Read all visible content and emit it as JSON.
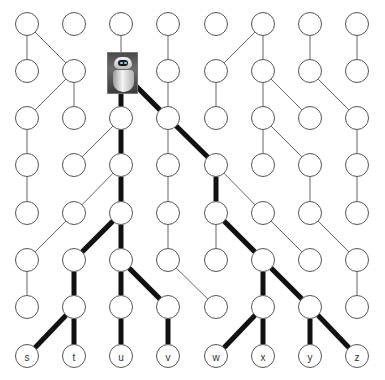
{
  "diagram": {
    "type": "tree-grid",
    "grid": {
      "columns_x": [
        27,
        74,
        121,
        168,
        216,
        263,
        310,
        357
      ],
      "rows_y": [
        24,
        71,
        118,
        165,
        213,
        260,
        307,
        356
      ],
      "node_radius": 11.5
    },
    "root_image": {
      "col": 2,
      "row": 1,
      "icon": "robot-icon",
      "label": "robot"
    },
    "leaf_labels": [
      "s",
      "t",
      "u",
      "v",
      "w",
      "x",
      "y",
      "z"
    ],
    "edges_thin": [
      [
        [
          0,
          0
        ],
        [
          0,
          1
        ]
      ],
      [
        [
          0,
          0
        ],
        [
          1,
          1
        ]
      ],
      [
        [
          2,
          0
        ],
        [
          2,
          1
        ]
      ],
      [
        [
          3,
          0
        ],
        [
          3,
          1
        ]
      ],
      [
        [
          5,
          0
        ],
        [
          4,
          1
        ]
      ],
      [
        [
          5,
          0
        ],
        [
          5,
          1
        ]
      ],
      [
        [
          6,
          0
        ],
        [
          6,
          1
        ]
      ],
      [
        [
          7,
          0
        ],
        [
          7,
          1
        ]
      ],
      [
        [
          1,
          1
        ],
        [
          0,
          2
        ]
      ],
      [
        [
          1,
          1
        ],
        [
          1,
          2
        ]
      ],
      [
        [
          3,
          1
        ],
        [
          3,
          2
        ]
      ],
      [
        [
          4,
          1
        ],
        [
          4,
          2
        ]
      ],
      [
        [
          5,
          1
        ],
        [
          5,
          2
        ]
      ],
      [
        [
          5,
          1
        ],
        [
          6,
          2
        ]
      ],
      [
        [
          6,
          1
        ],
        [
          7,
          2
        ]
      ],
      [
        [
          0,
          2
        ],
        [
          0,
          3
        ]
      ],
      [
        [
          2,
          2
        ],
        [
          1,
          3
        ]
      ],
      [
        [
          3,
          2
        ],
        [
          3,
          3
        ]
      ],
      [
        [
          5,
          2
        ],
        [
          5,
          3
        ]
      ],
      [
        [
          5,
          2
        ],
        [
          6,
          3
        ]
      ],
      [
        [
          7,
          2
        ],
        [
          7,
          3
        ]
      ],
      [
        [
          0,
          3
        ],
        [
          0,
          4
        ]
      ],
      [
        [
          2,
          3
        ],
        [
          1,
          4
        ]
      ],
      [
        [
          3,
          3
        ],
        [
          3,
          4
        ]
      ],
      [
        [
          4,
          3
        ],
        [
          5,
          4
        ]
      ],
      [
        [
          6,
          3
        ],
        [
          6,
          4
        ]
      ],
      [
        [
          7,
          3
        ],
        [
          7,
          4
        ]
      ],
      [
        [
          1,
          4
        ],
        [
          0,
          5
        ]
      ],
      [
        [
          3,
          4
        ],
        [
          3,
          5
        ]
      ],
      [
        [
          4,
          4
        ],
        [
          4,
          5
        ]
      ],
      [
        [
          5,
          4
        ],
        [
          6,
          5
        ]
      ],
      [
        [
          6,
          4
        ],
        [
          7,
          5
        ]
      ],
      [
        [
          0,
          5
        ],
        [
          0,
          6
        ]
      ],
      [
        [
          3,
          5
        ],
        [
          4,
          6
        ]
      ],
      [
        [
          7,
          5
        ],
        [
          7,
          6
        ]
      ]
    ],
    "edges_thick": [
      [
        [
          2,
          1
        ],
        [
          2,
          2
        ]
      ],
      [
        [
          2,
          1
        ],
        [
          3,
          2
        ]
      ],
      [
        [
          2,
          2
        ],
        [
          2,
          3
        ]
      ],
      [
        [
          3,
          2
        ],
        [
          4,
          3
        ]
      ],
      [
        [
          2,
          3
        ],
        [
          2,
          4
        ]
      ],
      [
        [
          4,
          3
        ],
        [
          4,
          4
        ]
      ],
      [
        [
          2,
          4
        ],
        [
          1,
          5
        ]
      ],
      [
        [
          2,
          4
        ],
        [
          2,
          5
        ]
      ],
      [
        [
          4,
          4
        ],
        [
          5,
          5
        ]
      ],
      [
        [
          1,
          5
        ],
        [
          1,
          6
        ]
      ],
      [
        [
          2,
          5
        ],
        [
          2,
          6
        ]
      ],
      [
        [
          2,
          5
        ],
        [
          3,
          6
        ]
      ],
      [
        [
          5,
          5
        ],
        [
          5,
          6
        ]
      ],
      [
        [
          5,
          5
        ],
        [
          6,
          6
        ]
      ],
      [
        [
          1,
          6
        ],
        [
          0,
          7
        ]
      ],
      [
        [
          1,
          6
        ],
        [
          1,
          7
        ]
      ],
      [
        [
          2,
          6
        ],
        [
          2,
          7
        ]
      ],
      [
        [
          3,
          6
        ],
        [
          3,
          7
        ]
      ],
      [
        [
          5,
          6
        ],
        [
          4,
          7
        ]
      ],
      [
        [
          5,
          6
        ],
        [
          5,
          7
        ]
      ],
      [
        [
          6,
          6
        ],
        [
          6,
          7
        ]
      ],
      [
        [
          6,
          6
        ],
        [
          7,
          7
        ]
      ]
    ],
    "colors": {
      "node_stroke": "#555555",
      "thin_edge": "#666666",
      "thick_edge": "#111111",
      "background": "#ffffff"
    }
  }
}
